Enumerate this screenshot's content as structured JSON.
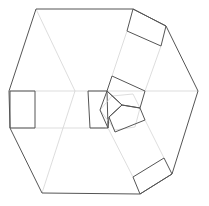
{
  "diagram": {
    "colors": {
      "outline": "#555555",
      "guide": "#d4d4d4",
      "background": "#ffffff"
    },
    "outline": "36,9 133,9 166,26 198,91 172,174 140,194 42,193 10,128 9,91",
    "guides": [
      [
        36,
        9,
        75,
        91
      ],
      [
        42,
        193,
        75,
        91
      ],
      [
        9,
        91,
        198,
        91
      ],
      [
        10,
        128,
        105,
        128
      ],
      [
        127,
        31,
        112,
        76
      ],
      [
        161,
        46,
        145,
        91
      ],
      [
        108,
        128,
        133,
        177
      ],
      [
        145,
        120,
        164,
        158
      ]
    ],
    "rects": [
      "10,91 35,91 35,128 10,128",
      "133,9 166,26 161,46 127,31",
      "133,177 164,158 172,174 140,194"
    ],
    "center_square": "88,91 107,91 108,128 90,128",
    "pentagons": [
      "107,91 112,76 145,91 140,108 122,105",
      "122,105 140,108 145,120 115,132 109,117",
      "107,91 122,105 109,117 108,128 100,110"
    ],
    "inner_faint": "100,110 112,96 133,94 140,108 135,127 115,130"
  }
}
